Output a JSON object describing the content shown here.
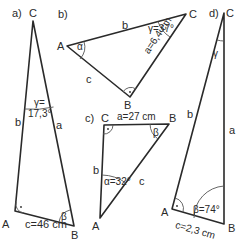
{
  "triangles": [
    {
      "id": "a",
      "label": "a)",
      "vertices": {
        "A": "A",
        "B": "B",
        "C": "C"
      },
      "sides": {
        "a": "a",
        "b": "b",
        "c": "c=46 cm"
      },
      "angles": {
        "gamma_1": "γ=",
        "gamma_2": "17,3°",
        "beta": "β"
      },
      "right_angle_at": "A"
    },
    {
      "id": "b",
      "label": "b)",
      "vertices": {
        "A": "A",
        "B": "B",
        "C": "C"
      },
      "sides": {
        "a": "a=6,4 cm",
        "b": "b",
        "c": "c"
      },
      "angles": {
        "alpha": "α",
        "gamma": "γ=37°"
      },
      "right_angle_at": "B"
    },
    {
      "id": "c",
      "label": "c)",
      "vertices": {
        "A": "A",
        "B": "B",
        "C": "C"
      },
      "sides": {
        "a": "a=27 cm",
        "b": "b",
        "c": "c"
      },
      "angles": {
        "alpha": "α=32°",
        "beta": "β"
      },
      "right_angle_at": "C"
    },
    {
      "id": "d",
      "label": "d)",
      "vertices": {
        "A": "A",
        "B": "B",
        "C": "C"
      },
      "sides": {
        "a": "a",
        "b": "b",
        "c": "c=2,3 cm"
      },
      "angles": {
        "gamma": "γ",
        "beta": "β=74°"
      },
      "right_angle_at": "A"
    }
  ],
  "colors": {
    "line": "#2a2a2a",
    "arc": "#555555"
  }
}
